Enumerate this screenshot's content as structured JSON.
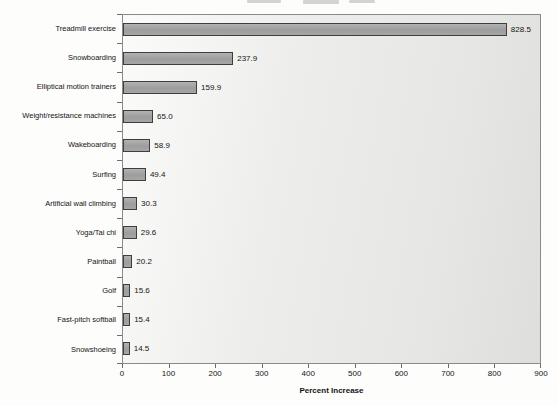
{
  "figure": {
    "background": "#fdfdfc",
    "title_cropped": true
  },
  "chart_data": {
    "type": "bar",
    "orientation": "horizontal",
    "title": "",
    "xlabel": "Percent Increase",
    "ylabel": "",
    "categories": [
      "Treadmill exercise",
      "Snowboarding",
      "Elliptical motion trainers",
      "Weight/resistance machines",
      "Wakeboarding",
      "Surfing",
      "Artificial wall climbing",
      "Yoga/Tai chi",
      "Paintball",
      "Golf",
      "Fast-pitch softball",
      "Snowshoeing"
    ],
    "values": [
      828.5,
      237.9,
      159.9,
      65.0,
      58.9,
      49.4,
      30.3,
      29.6,
      20.2,
      15.6,
      15.4,
      14.5
    ],
    "value_labels": [
      "828.5",
      "237.9",
      "159.9",
      "65.0",
      "58.9",
      "49.4",
      "30.3",
      "29.6",
      "20.2",
      "15.6",
      "15.4",
      "14.5"
    ],
    "xlim": [
      0,
      900
    ],
    "x_ticks": [
      0,
      100,
      200,
      300,
      400,
      500,
      600,
      700,
      800,
      900
    ],
    "grid": false,
    "legend": null,
    "colors": {
      "bar_fill": "#a2a2a2",
      "bar_border": "#3e3e3e",
      "plot_background": "#ebebe9",
      "plot_border": "#8a8a8a",
      "text": "#141414"
    }
  }
}
